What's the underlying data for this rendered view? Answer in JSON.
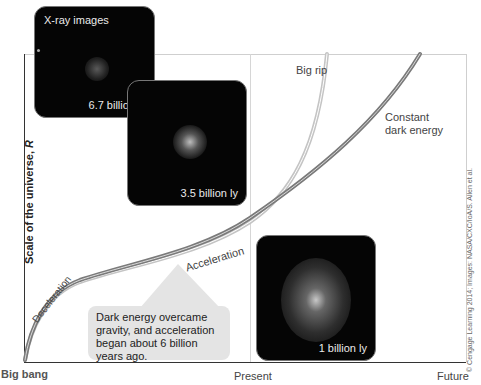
{
  "axes": {
    "y_label_main": "Scale of the universe, ",
    "y_label_var": "R",
    "x_start": "Big bang",
    "x_mid": "Present",
    "x_end": "Future"
  },
  "curves": {
    "big_rip_label": "Big rip",
    "constant_label_line1": "Constant",
    "constant_label_line2": "dark energy",
    "deceleration_label": "Deceleration",
    "acceleration_label": "Acceleration"
  },
  "images": {
    "title": "X-ray images",
    "panels": [
      {
        "caption": "6.7 billion ly"
      },
      {
        "caption": "3.5 billion ly"
      },
      {
        "caption": "1 billion ly"
      }
    ]
  },
  "callout": {
    "text": "Dark energy overcame gravity, and acceleration began about 6 billion years ago."
  },
  "credit": "© Cengage Learning 2014; Images: NASA/CXC/IoA/S. Allen et al.",
  "colors": {
    "curve_dark": "#6e6e6e",
    "curve_light": "#b8b8b8",
    "image_bg": "#050505",
    "callout_bg": "#e4e4e4"
  }
}
